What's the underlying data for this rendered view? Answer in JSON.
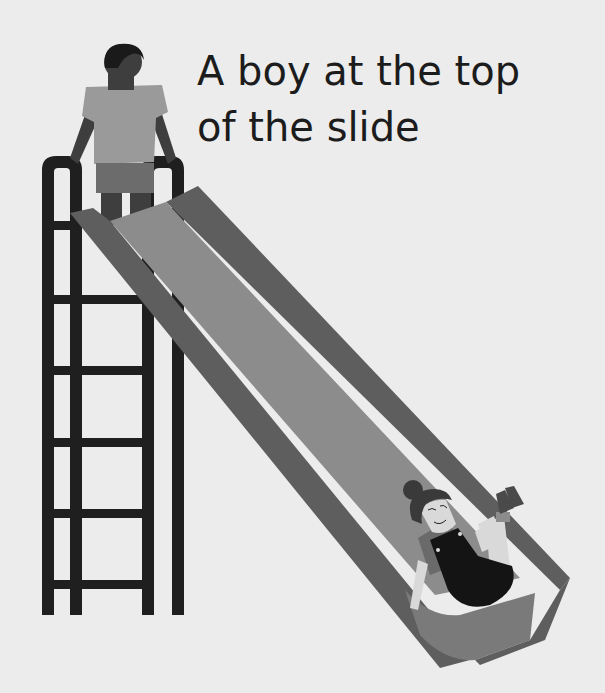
{
  "caption": {
    "line1": "A boy at the top",
    "line2": "of the slide"
  },
  "colors": {
    "background": "#ececec",
    "text": "#1c1c1c",
    "ladder": "#1f1f1f",
    "slide_rail": "#5e5e5e",
    "slide_bed": "#8c8c8c",
    "slide_end": "#7a7a7a",
    "boy_skin": "#3e3e3e",
    "boy_hair": "#1a1a1a",
    "boy_shirt": "#9a9a9a",
    "boy_shorts": "#6c6c6c",
    "girl_skin": "#d9d9d9",
    "girl_hair": "#3a3a3a",
    "girl_overalls": "#141414",
    "girl_shirt": "#6a6a6a",
    "girl_shoes": "#4a4a4a"
  },
  "figures": [
    {
      "name": "boy",
      "description": "boy standing at top of ladder holding rails"
    },
    {
      "name": "girl",
      "description": "girl sliding down, legs raised"
    }
  ]
}
